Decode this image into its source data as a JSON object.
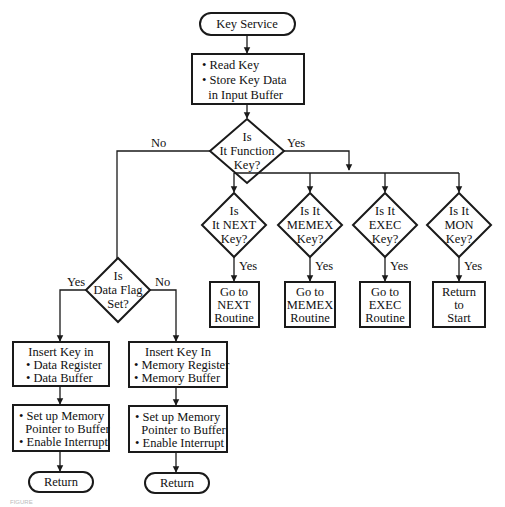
{
  "diagram": {
    "start": {
      "label": "Key Service"
    },
    "read_box": {
      "lines": [
        "• Read Key",
        "• Store Key Data",
        "  in Input Buffer"
      ]
    },
    "function_decision": {
      "lines": [
        "Is",
        "It Function",
        "Key?"
      ],
      "no_label": "No",
      "yes_label": "Yes"
    },
    "function_keys": [
      {
        "decision": [
          "Is",
          "It NEXT",
          "Key?"
        ],
        "yes_label": "Yes",
        "action": [
          "Go to",
          "NEXT",
          "Routine"
        ]
      },
      {
        "decision": [
          "Is It",
          "MEMEX",
          "Key?"
        ],
        "yes_label": "Yes",
        "action": [
          "Go to",
          "MEMEX",
          "Routine"
        ]
      },
      {
        "decision": [
          "Is It",
          "EXEC",
          "Key?"
        ],
        "yes_label": "Yes",
        "action": [
          "Go to",
          "EXEC",
          "Routine"
        ]
      },
      {
        "decision": [
          "Is It",
          "MON",
          "Key?"
        ],
        "yes_label": "Yes",
        "action": [
          "Return",
          "to",
          "Start"
        ]
      }
    ],
    "data_flag_decision": {
      "lines": [
        "Is",
        "Data Flag",
        "Set?"
      ],
      "yes_label": "Yes",
      "no_label": "No"
    },
    "data_branch": {
      "insert_box": [
        "Insert Key in",
        "• Data Register",
        "• Data Buffer"
      ],
      "setup_box": [
        "• Set up Memory",
        "  Pointer to Buffer",
        "• Enable Interrupt"
      ],
      "end": {
        "label": "Return"
      }
    },
    "memory_branch": {
      "insert_box": [
        "Insert Key In",
        "• Memory Register",
        "• Memory Buffer"
      ],
      "setup_box": [
        "• Set up Memory",
        "  Pointer to Buffer",
        "• Enable Interrupt"
      ],
      "end": {
        "label": "Return"
      }
    },
    "caption": "FIGURE"
  },
  "colors": {
    "stroke": "#1a1a1a",
    "background": "#ffffff",
    "text": "#111111"
  }
}
